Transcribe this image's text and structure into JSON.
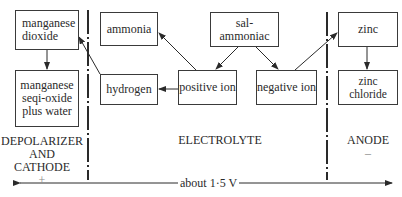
{
  "diagram": {
    "boxes": {
      "manganese_dioxide": "manganese\ndioxide",
      "manganese_seqi_oxide": "manganese\nseqi-oxide\nplus water",
      "ammonia": "ammonia",
      "hydrogen": "hydrogen",
      "sal_ammoniac": "sal-ammoniac",
      "positive_ion": "positive ion",
      "negative_ion": "negative ion",
      "zinc": "zinc",
      "zinc_chloride": "zinc chloride"
    },
    "regions": {
      "cathode": {
        "line1": "DEPOLARIZER",
        "line2": "AND",
        "line3": "CATHODE",
        "sign": "+"
      },
      "electrolyte": {
        "label": "ELECTROLYTE"
      },
      "anode": {
        "label": "ANODE",
        "sign": "–"
      }
    },
    "voltage_label": "about 1·5 V",
    "colors": {
      "line": "#2a2a2a",
      "background": "#ffffff"
    }
  }
}
